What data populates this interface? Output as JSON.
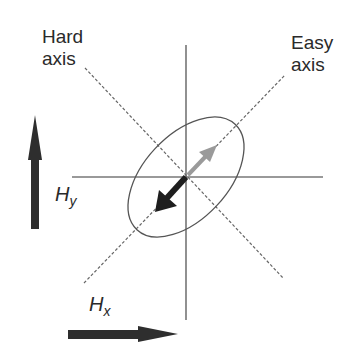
{
  "diagram": {
    "labels": {
      "hard_axis": {
        "line1": "Hard",
        "line2": "axis"
      },
      "easy_axis": {
        "line1": "Easy",
        "line2": "axis"
      },
      "field_y": {
        "main": "H",
        "sub": "y"
      },
      "field_x": {
        "main": "H",
        "sub": "x"
      }
    },
    "colors": {
      "line": "#555555",
      "dashed": "#666666",
      "arrow_dark": "#1e1e1e",
      "arrow_light": "#9a9a9a",
      "field_arrow": "#2e2e2e",
      "text": "#2a2a2a",
      "background": "#ffffff"
    },
    "elements": [
      {
        "type": "axis-line",
        "orientation": "vertical"
      },
      {
        "type": "axis-line",
        "orientation": "horizontal"
      },
      {
        "type": "dashed-line",
        "name": "hard axis",
        "direction": "top-left to bottom-right"
      },
      {
        "type": "dashed-line",
        "name": "easy axis",
        "direction": "bottom-left to top-right"
      },
      {
        "type": "ellipse",
        "orientation": "tilted 45° along easy axis"
      },
      {
        "type": "arrow",
        "color": "dark",
        "direction": "down-left along easy axis"
      },
      {
        "type": "arrow",
        "color": "gray",
        "direction": "up-right along easy axis"
      },
      {
        "type": "field-arrow",
        "name": "Hy",
        "direction": "up"
      },
      {
        "type": "field-arrow",
        "name": "Hx",
        "direction": "right"
      }
    ]
  }
}
